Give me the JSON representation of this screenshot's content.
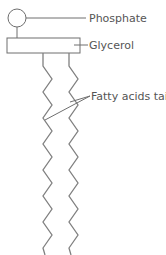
{
  "diagram": {
    "labels": {
      "phosphate": "Phosphate",
      "glycerol": "Glycerol",
      "tails": "Fatty acids tails"
    },
    "colors": {
      "line": "#6e6e6e",
      "tail": "#808080",
      "text": "#555555",
      "background": "#ffffff"
    },
    "parts": [
      "phosphate-head",
      "glycerol-backbone",
      "fatty-acid-tail-left",
      "fatty-acid-tail-right"
    ]
  }
}
